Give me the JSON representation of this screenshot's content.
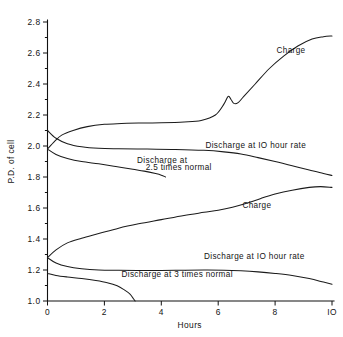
{
  "chart_data": {
    "type": "line",
    "title": "",
    "xlabel": "Hours",
    "ylabel": "P.D. of cell",
    "xlim": [
      0,
      10
    ],
    "ylim": [
      1.0,
      2.8
    ],
    "grid": false,
    "legend_position": "inline-annotations",
    "x_ticks": [
      "0",
      "2",
      "4",
      "6",
      "8",
      "IO"
    ],
    "x_tick_values": [
      0,
      2,
      4,
      6,
      8,
      10
    ],
    "y_ticks": [
      "2.8",
      "2.6",
      "2.4",
      "2.2",
      "2.0",
      "1.8",
      "1.6",
      "1.4",
      "1.2",
      "1.0"
    ],
    "y_tick_values": [
      2.8,
      2.6,
      2.4,
      2.2,
      2.0,
      1.8,
      1.6,
      1.4,
      1.2,
      1.0
    ],
    "y_minor_tick_values": [
      2.7,
      2.5,
      2.3,
      2.1,
      1.9,
      1.7,
      1.5,
      1.3,
      1.1
    ],
    "series": [
      {
        "name": "Charge (upper)",
        "label": "Charge",
        "x": [
          0,
          0.25,
          0.5,
          0.9,
          1.4,
          2.0,
          2.6,
          3.2,
          4.0,
          4.8,
          5.4,
          5.9,
          6.2,
          6.35,
          6.45,
          6.55,
          6.7,
          6.9,
          7.3,
          7.8,
          8.3,
          8.8,
          9.3,
          9.7,
          10.0
        ],
        "y": [
          1.98,
          2.03,
          2.07,
          2.1,
          2.125,
          2.14,
          2.145,
          2.148,
          2.15,
          2.155,
          2.165,
          2.2,
          2.27,
          2.32,
          2.3,
          2.275,
          2.28,
          2.32,
          2.4,
          2.5,
          2.58,
          2.645,
          2.69,
          2.705,
          2.71
        ]
      },
      {
        "name": "Discharge at IO hour rate (upper)",
        "label": "Discharge at IO hour rate",
        "x": [
          0,
          0.3,
          0.7,
          1.2,
          1.8,
          2.5,
          3.5,
          4.5,
          5.5,
          6.2,
          6.8,
          7.4,
          8.0,
          8.6,
          9.2,
          9.7,
          10.0
        ],
        "y": [
          2.1,
          2.05,
          2.015,
          1.995,
          1.985,
          1.982,
          1.98,
          1.978,
          1.972,
          1.962,
          1.948,
          1.925,
          1.9,
          1.873,
          1.845,
          1.822,
          1.81
        ]
      },
      {
        "name": "Discharge at 2.5 times normal",
        "label": "Discharge at 2.5 times normal",
        "x": [
          0,
          0.3,
          0.7,
          1.2,
          1.8,
          2.4,
          3.0,
          3.4,
          3.8,
          4.0,
          4.15
        ],
        "y": [
          1.98,
          1.945,
          1.92,
          1.9,
          1.885,
          1.868,
          1.85,
          1.838,
          1.822,
          1.812,
          1.8
        ]
      },
      {
        "name": "Charge (lower)",
        "label": "Charge",
        "x": [
          0,
          0.3,
          0.7,
          1.2,
          1.8,
          2.5,
          3.2,
          4.0,
          4.8,
          5.5,
          6.0,
          6.5,
          7.0,
          7.5,
          8.0,
          8.6,
          9.2,
          9.6,
          10.0
        ],
        "y": [
          1.28,
          1.33,
          1.375,
          1.405,
          1.435,
          1.47,
          1.498,
          1.525,
          1.552,
          1.572,
          1.586,
          1.605,
          1.63,
          1.662,
          1.69,
          1.715,
          1.733,
          1.738,
          1.733
        ]
      },
      {
        "name": "Discharge at IO hour rate (lower)",
        "label": "Discharge at IO hour rate",
        "x": [
          0,
          0.3,
          0.7,
          1.2,
          1.8,
          2.5,
          3.5,
          4.5,
          5.5,
          6.2,
          6.8,
          7.4,
          8.0,
          8.6,
          9.2,
          9.7,
          10.0
        ],
        "y": [
          1.28,
          1.245,
          1.222,
          1.208,
          1.2,
          1.198,
          1.197,
          1.198,
          1.2,
          1.199,
          1.195,
          1.188,
          1.178,
          1.165,
          1.145,
          1.122,
          1.108
        ]
      },
      {
        "name": "Discharge at 3 times normal",
        "label": "Discharge at 3 times normal",
        "x": [
          0,
          0.3,
          0.7,
          1.2,
          1.7,
          2.1,
          2.45,
          2.7,
          2.9,
          3.0,
          3.08
        ],
        "y": [
          1.178,
          1.165,
          1.155,
          1.145,
          1.132,
          1.118,
          1.098,
          1.072,
          1.045,
          1.02,
          1.0
        ]
      }
    ],
    "annotations": [
      {
        "text": "Charge",
        "x": 8.05,
        "y": 2.6,
        "name": "label-charge-upper"
      },
      {
        "text": "Discharge at IO hour rate",
        "x": 5.55,
        "y": 1.985,
        "name": "label-discharge-10hr-upper"
      },
      {
        "text": "Discharge at",
        "x": 3.15,
        "y": 1.888,
        "name": "label-discharge-2p5-line1"
      },
      {
        "text": "2.5 times normal",
        "x": 3.45,
        "y": 1.843,
        "name": "label-discharge-2p5-line2"
      },
      {
        "text": "Charge",
        "x": 6.85,
        "y": 1.6,
        "name": "label-charge-lower"
      },
      {
        "text": "Discharge at IO hour rate",
        "x": 5.5,
        "y": 1.272,
        "name": "label-discharge-10hr-lower"
      },
      {
        "text": "Discharge at 3 times normal",
        "x": 2.6,
        "y": 1.152,
        "name": "label-discharge-3x"
      }
    ]
  }
}
